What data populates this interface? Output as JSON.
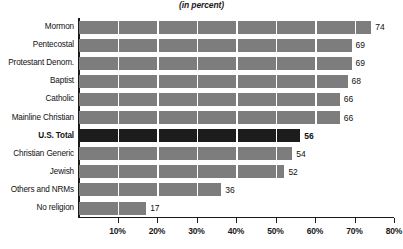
{
  "chart_data": {
    "type": "bar",
    "orientation": "horizontal",
    "title": "",
    "subtitle": "(in percent)",
    "xlabel": "",
    "ylabel": "",
    "xlim": [
      0,
      80
    ],
    "grid": true,
    "legend": false,
    "categories": [
      "Mormon",
      "Pentecostal",
      "Protestant Denom.",
      "Baptist",
      "Catholic",
      "Mainline Christian",
      "U.S. Total",
      "Christian Generic",
      "Jewish",
      "Others and NRMs",
      "No  religion"
    ],
    "values": [
      74,
      69,
      69,
      68,
      66,
      66,
      56,
      54,
      52,
      36,
      17
    ],
    "value_labels": [
      "74",
      "69",
      "69",
      "68",
      "66",
      "66",
      "56",
      "54",
      "52",
      "36",
      "17"
    ],
    "emphasis_index": 6,
    "xticks": [
      10,
      20,
      30,
      40,
      50,
      60,
      70,
      80
    ],
    "xticklabels": [
      "10%",
      "20%",
      "30%",
      "40%",
      "50%",
      "60%",
      "70%",
      "80%"
    ],
    "colors": {
      "bar": "#7d7d7d",
      "bar_emphasis": "#1c1c1c",
      "gridline": "#ffffff",
      "axis": "#1a1a1a",
      "text": "#111111",
      "background": "#ffffff"
    }
  }
}
